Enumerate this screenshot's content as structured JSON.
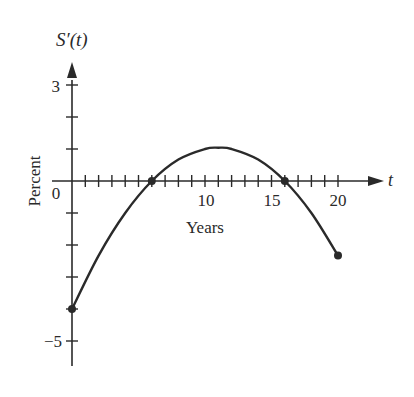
{
  "chart_data": {
    "type": "line",
    "title": "",
    "xlabel": "Years",
    "ylabel": "Percent",
    "x_axis_name": "t",
    "y_axis_name": "S′(t)",
    "xlim": [
      0,
      20
    ],
    "ylim": [
      -5,
      3
    ],
    "x_ticks": [
      0,
      1,
      2,
      3,
      4,
      5,
      6,
      7,
      8,
      9,
      10,
      11,
      12,
      13,
      14,
      15,
      16,
      17,
      18,
      19,
      20
    ],
    "x_tick_labels": [
      {
        "value": 0,
        "label": "0"
      },
      {
        "value": 10,
        "label": "10"
      },
      {
        "value": 15,
        "label": "15"
      },
      {
        "value": 20,
        "label": "20"
      }
    ],
    "y_ticks": [
      -5,
      -4,
      -3,
      -2,
      -1,
      0,
      1,
      2,
      3
    ],
    "y_tick_labels": [
      {
        "value": 3,
        "label": "3"
      },
      {
        "value": -5,
        "label": "−5"
      }
    ],
    "grid": false,
    "legend": null,
    "series": [
      {
        "name": "S′(t)",
        "x": [
          0,
          2,
          4,
          6,
          8,
          10,
          11,
          12,
          14,
          16,
          18,
          20
        ],
        "values": [
          -4.0,
          -2.33,
          -1.0,
          0.0,
          0.67,
          1.0,
          1.04,
          1.0,
          0.67,
          0.0,
          -1.0,
          -2.33
        ]
      }
    ],
    "marked_points": [
      {
        "x": 0,
        "y": -4.0
      },
      {
        "x": 6,
        "y": 0
      },
      {
        "x": 16,
        "y": 0
      },
      {
        "x": 20,
        "y": -2.33
      }
    ]
  },
  "labels": {
    "y_axis_name": "S′(t)",
    "x_axis_name": "t",
    "xlabel": "Years",
    "ylabel": "Percent",
    "origin": "0",
    "x10": "10",
    "x15": "15",
    "x20": "20",
    "y3": "3",
    "yneg5": "−5"
  },
  "colors": {
    "ink": "#2a2a2a",
    "background": "#ffffff"
  }
}
